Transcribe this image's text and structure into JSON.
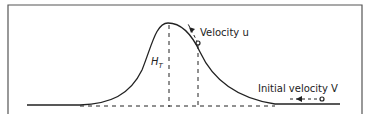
{
  "labels": {
    "velocity_u": "Velocity u",
    "height": "H",
    "height_sub": "T",
    "initial_velocity": "Initial velocity V"
  },
  "colors": {
    "line": "#222222",
    "frame": "#555555",
    "background": "#ffffff"
  }
}
